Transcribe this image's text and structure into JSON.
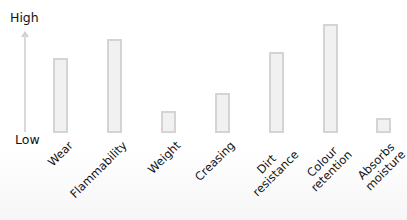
{
  "chart_data": {
    "type": "bar",
    "title": "",
    "xlabel": "",
    "ylabel": "",
    "y_axis": {
      "top_label": "High",
      "bottom_label": "Low",
      "numeric_ticks": false
    },
    "categories": [
      "Wear",
      "Flammability",
      "Weight",
      "Creasing",
      "Dirt resistance",
      "Colour retention",
      "Absorbs moisture"
    ],
    "category_lines": [
      [
        "Wear"
      ],
      [
        "Flammability"
      ],
      [
        "Weight"
      ],
      [
        "Creasing"
      ],
      [
        "Dirt",
        "resistance"
      ],
      [
        "Colour",
        "retention"
      ],
      [
        "Absorbs",
        "moisture"
      ]
    ],
    "values": [
      73,
      92,
      20,
      38,
      79,
      107,
      13
    ],
    "value_scale": "relative (0 = Low baseline, ~100 = near High)",
    "ylim": [
      0,
      110
    ],
    "grid": false,
    "legend": null,
    "colors": {
      "bar_fill": "#f1f1f1",
      "bar_border": "#d4d4d4",
      "axis": "#d9d9d9"
    }
  }
}
